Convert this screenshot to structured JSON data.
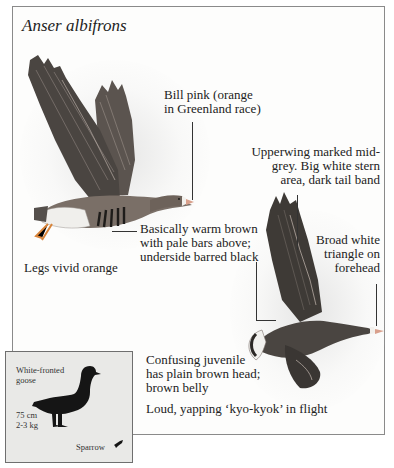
{
  "page": {
    "species_latin": "Anser albifrons"
  },
  "annotations": {
    "bill": "Bill pink (orange\nin Greenland race)",
    "upperwing": "Upperwing marked mid-\ngrey. Big white stern\narea, dark tail band",
    "body": "Basically warm brown\nwith pale bars above;\nunderside barred black",
    "forehead": "Broad white\ntriangle on\nforehead",
    "legs": "Legs vivid orange",
    "juvenile": "Confusing juvenile\nhas plain brown head;\nbrown belly",
    "call": "Loud, yapping ‘kyo-kyok’ in flight"
  },
  "size_box": {
    "name": "White-fronted\ngoose",
    "length": "75 cm",
    "weight": "2-3 kg",
    "comparison": "Sparrow"
  },
  "illustrations": {
    "goose_left": "white-fronted-goose-flying-left-view",
    "goose_right": "white-fronted-goose-flying-underside-view",
    "goose_silhouette": "goose-silhouette",
    "sparrow_silhouette": "sparrow-silhouette"
  },
  "colors": {
    "frame_border": "#8a8a8a",
    "inset_bg": "#e9e9e7",
    "plumage_dark": "#3e3a36",
    "plumage_brown": "#6d625a",
    "bill": "#d9a08c",
    "legs": "#e08a3a"
  }
}
